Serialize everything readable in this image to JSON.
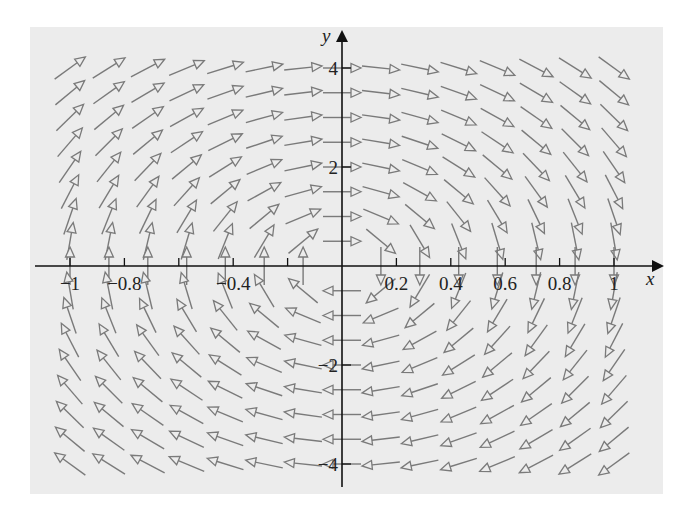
{
  "chart_data": {
    "type": "vector_field",
    "title": "",
    "xlabel": "x",
    "ylabel": "y",
    "xlim": [
      -1.0,
      1.0
    ],
    "ylim": [
      -4.3,
      4.3
    ],
    "x_ticks": [
      -1,
      -0.8,
      -0.6,
      -0.4,
      -0.2,
      0.2,
      0.4,
      0.6,
      0.8,
      1
    ],
    "x_tick_labels": [
      "-1",
      "-0.8",
      "",
      "-0.4",
      "",
      "0.2",
      "0.4",
      "0.6",
      "0.8",
      "1"
    ],
    "y_ticks": [
      -4,
      -2,
      2,
      4
    ],
    "y_tick_labels": [
      "-4",
      "-2",
      "2",
      "4"
    ],
    "grid": false,
    "legend": null,
    "field": {
      "description": "Rotational direction field: arrows point right above x-axis near y-axis, left below; up for x<0 and down for x>0 on x-axis (clockwise circulation about origin)",
      "vector_formula": "F(x,y) = (y, -16x)",
      "arrow_length_uniform": true,
      "sample_x": [
        -1,
        -0.857,
        -0.714,
        -0.571,
        -0.429,
        -0.286,
        -0.143,
        0,
        0.143,
        0.286,
        0.429,
        0.571,
        0.714,
        0.857,
        1
      ],
      "sample_y": [
        4,
        3.5,
        3,
        2.5,
        2,
        1.5,
        1,
        0.5,
        0,
        -0.5,
        -1,
        -1.5,
        -2,
        -2.5,
        -3,
        -3.5,
        -4
      ]
    },
    "colors": {
      "arrow": "#7a7a7a",
      "axis": "#111111",
      "background": "#ececec"
    }
  }
}
